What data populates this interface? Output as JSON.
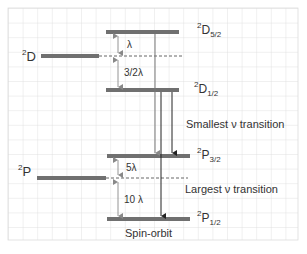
{
  "diagram": {
    "title": "Spin-orbit",
    "terms": [
      {
        "id": "2D",
        "sup": "2",
        "base": "D",
        "sub": ""
      },
      {
        "id": "2P",
        "sup": "2",
        "base": "P",
        "sub": ""
      }
    ],
    "levels": [
      {
        "id": "2D5/2",
        "sup": "2",
        "base": "D",
        "sub": "5/2"
      },
      {
        "id": "2D1/2",
        "sup": "2",
        "base": "D",
        "sub": "1/2"
      },
      {
        "id": "2P3/2",
        "sup": "2",
        "base": "P",
        "sub": "3/2"
      },
      {
        "id": "2P1/2",
        "sup": "2",
        "base": "P",
        "sub": "1/2"
      }
    ],
    "splittings": {
      "d_upper": "λ",
      "d_lower": "3/2λ",
      "p_upper": "5λ",
      "p_lower": "10 λ"
    },
    "annotations": {
      "smallest": "Smallest ν transition",
      "largest": "Largest ν transition"
    },
    "colors": {
      "level": "#707070",
      "grid": "#dcdcdc",
      "arrow": "#222222",
      "dim_arrow": "#888888"
    }
  }
}
